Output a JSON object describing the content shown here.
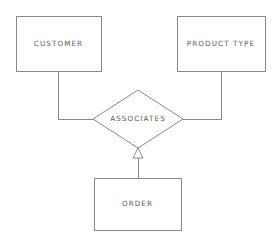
{
  "diagram": {
    "background_color": "#ffffff",
    "line_color": "#8a8a8a",
    "text_color": "#5c5c5c",
    "entities": [
      {
        "id": "customer",
        "label": "CUSTOMER",
        "shape": "rectangle",
        "x": 16,
        "y": 16,
        "width": 85,
        "height": 55
      },
      {
        "id": "product-type",
        "label": "PRODUCT TYPE",
        "shape": "rectangle",
        "x": 177,
        "y": 16,
        "width": 88,
        "height": 55
      },
      {
        "id": "order",
        "label": "ORDER",
        "shape": "rectangle",
        "x": 94,
        "y": 178,
        "width": 87,
        "height": 52
      }
    ],
    "relationships": [
      {
        "id": "associates",
        "label": "ASSOCIATES",
        "shape": "diamond",
        "cx": 138,
        "cy": 119,
        "half_width": 45,
        "half_height": 29
      }
    ],
    "connectors": [
      {
        "id": "customer-to-associates",
        "from": "customer",
        "to": "associates",
        "style": "orthogonal",
        "arrow": "none",
        "path": "M 58 71 L 58 119 L 93 119"
      },
      {
        "id": "product-type-to-associates",
        "from": "product-type",
        "to": "associates",
        "style": "orthogonal",
        "arrow": "none",
        "path": "M 221 71 L 221 119 L 183 119"
      },
      {
        "id": "order-to-associates",
        "from": "order",
        "to": "associates",
        "style": "straight",
        "arrow": "hollow-triangle",
        "path": "M 138 178 L 138 157",
        "arrow_points": "138,148 133,158 143,158"
      }
    ]
  }
}
